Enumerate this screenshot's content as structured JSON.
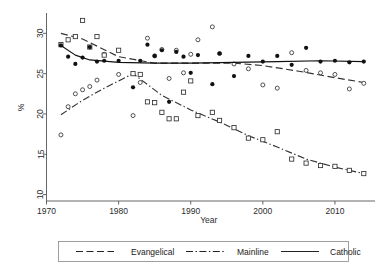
{
  "chart_data": {
    "type": "scatter",
    "title": "",
    "xlabel": "Year",
    "ylabel": "%",
    "xlim": [
      1970,
      2015
    ],
    "ylim": [
      9.2,
      32.4
    ],
    "xticks": [
      1970,
      1980,
      1990,
      2000,
      2010
    ],
    "yticks": [
      10,
      15,
      20,
      25,
      30
    ],
    "grid": false,
    "legend_position": "bottom",
    "series": [
      {
        "name": "Evangelical",
        "marker": "open-circle",
        "line_style": "dashed",
        "color": "#333333",
        "points": [
          {
            "x": 1972,
            "y": 17.4
          },
          {
            "x": 1973,
            "y": 20.9
          },
          {
            "x": 1974,
            "y": 22.5
          },
          {
            "x": 1975,
            "y": 23.0
          },
          {
            "x": 1976,
            "y": 23.4
          },
          {
            "x": 1977,
            "y": 24.2
          },
          {
            "x": 1978,
            "y": 27.4
          },
          {
            "x": 1980,
            "y": 24.9
          },
          {
            "x": 1982,
            "y": 19.8
          },
          {
            "x": 1983,
            "y": 23.9
          },
          {
            "x": 1984,
            "y": 29.4
          },
          {
            "x": 1985,
            "y": 27.2
          },
          {
            "x": 1986,
            "y": 28.0
          },
          {
            "x": 1987,
            "y": 24.4
          },
          {
            "x": 1988,
            "y": 27.9
          },
          {
            "x": 1989,
            "y": 25.1
          },
          {
            "x": 1990,
            "y": 27.4
          },
          {
            "x": 1991,
            "y": 29.2
          },
          {
            "x": 1993,
            "y": 30.8
          },
          {
            "x": 1994,
            "y": 27.5
          },
          {
            "x": 1996,
            "y": 26.2
          },
          {
            "x": 1998,
            "y": 25.6
          },
          {
            "x": 2000,
            "y": 23.6
          },
          {
            "x": 2002,
            "y": 23.2
          },
          {
            "x": 2004,
            "y": 27.6
          },
          {
            "x": 2006,
            "y": 25.4
          },
          {
            "x": 2008,
            "y": 25.1
          },
          {
            "x": 2010,
            "y": 24.9
          },
          {
            "x": 2012,
            "y": 23.1
          },
          {
            "x": 2014,
            "y": 23.8
          }
        ],
        "trend": [
          {
            "x": 1972,
            "y": 30.0
          },
          {
            "x": 1975,
            "y": 29.3
          },
          {
            "x": 1980,
            "y": 27.1
          },
          {
            "x": 1985,
            "y": 26.3
          },
          {
            "x": 1990,
            "y": 26.3
          },
          {
            "x": 1996,
            "y": 26.3
          },
          {
            "x": 2000,
            "y": 26.0
          },
          {
            "x": 2005,
            "y": 25.3
          },
          {
            "x": 2010,
            "y": 24.5
          },
          {
            "x": 2014,
            "y": 23.9
          }
        ]
      },
      {
        "name": "Mainline",
        "marker": "open-square",
        "line_style": "dash-dot",
        "color": "#333333",
        "points": [
          {
            "x": 1972,
            "y": 28.6
          },
          {
            "x": 1973,
            "y": 29.2
          },
          {
            "x": 1974,
            "y": 29.6
          },
          {
            "x": 1975,
            "y": 31.6
          },
          {
            "x": 1976,
            "y": 28.3
          },
          {
            "x": 1977,
            "y": 29.6
          },
          {
            "x": 1978,
            "y": 27.3
          },
          {
            "x": 1980,
            "y": 27.9
          },
          {
            "x": 1982,
            "y": 25.0
          },
          {
            "x": 1983,
            "y": 24.9
          },
          {
            "x": 1984,
            "y": 21.5
          },
          {
            "x": 1985,
            "y": 21.4
          },
          {
            "x": 1986,
            "y": 20.2
          },
          {
            "x": 1987,
            "y": 19.4
          },
          {
            "x": 1988,
            "y": 19.4
          },
          {
            "x": 1989,
            "y": 22.7
          },
          {
            "x": 1990,
            "y": 24.1
          },
          {
            "x": 1991,
            "y": 19.8
          },
          {
            "x": 1993,
            "y": 20.2
          },
          {
            "x": 1994,
            "y": 19.2
          },
          {
            "x": 1996,
            "y": 18.3
          },
          {
            "x": 1998,
            "y": 17.0
          },
          {
            "x": 2000,
            "y": 16.8
          },
          {
            "x": 2002,
            "y": 17.8
          },
          {
            "x": 2004,
            "y": 14.4
          },
          {
            "x": 2006,
            "y": 13.9
          },
          {
            "x": 2008,
            "y": 13.6
          },
          {
            "x": 2010,
            "y": 13.5
          },
          {
            "x": 2012,
            "y": 13.0
          },
          {
            "x": 2014,
            "y": 12.6
          }
        ],
        "trend": [
          {
            "x": 1972,
            "y": 19.9
          },
          {
            "x": 1975,
            "y": 21.7
          },
          {
            "x": 1978,
            "y": 23.2
          },
          {
            "x": 1982,
            "y": 25.0
          },
          {
            "x": 1986,
            "y": 22.3
          },
          {
            "x": 1990,
            "y": 20.5
          },
          {
            "x": 1994,
            "y": 19.0
          },
          {
            "x": 1998,
            "y": 17.3
          },
          {
            "x": 2002,
            "y": 15.9
          },
          {
            "x": 2006,
            "y": 14.4
          },
          {
            "x": 2010,
            "y": 13.4
          },
          {
            "x": 2014,
            "y": 12.6
          }
        ]
      },
      {
        "name": "Catholic",
        "marker": "filled-circle",
        "line_style": "solid",
        "color": "#111111",
        "points": [
          {
            "x": 1972,
            "y": 28.5
          },
          {
            "x": 1973,
            "y": 27.1
          },
          {
            "x": 1974,
            "y": 26.2
          },
          {
            "x": 1975,
            "y": 27.0
          },
          {
            "x": 1976,
            "y": 28.3
          },
          {
            "x": 1977,
            "y": 26.5
          },
          {
            "x": 1978,
            "y": 26.6
          },
          {
            "x": 1980,
            "y": 26.6
          },
          {
            "x": 1982,
            "y": 23.3
          },
          {
            "x": 1983,
            "y": 26.6
          },
          {
            "x": 1984,
            "y": 28.6
          },
          {
            "x": 1985,
            "y": 27.2
          },
          {
            "x": 1986,
            "y": 27.9
          },
          {
            "x": 1987,
            "y": 21.5
          },
          {
            "x": 1988,
            "y": 27.7
          },
          {
            "x": 1989,
            "y": 27.1
          },
          {
            "x": 1990,
            "y": 25.1
          },
          {
            "x": 1991,
            "y": 27.3
          },
          {
            "x": 1993,
            "y": 23.7
          },
          {
            "x": 1994,
            "y": 27.5
          },
          {
            "x": 1996,
            "y": 24.7
          },
          {
            "x": 1998,
            "y": 27.2
          },
          {
            "x": 2000,
            "y": 26.5
          },
          {
            "x": 2002,
            "y": 27.2
          },
          {
            "x": 2004,
            "y": 26.1
          },
          {
            "x": 2006,
            "y": 28.2
          },
          {
            "x": 2008,
            "y": 26.5
          },
          {
            "x": 2010,
            "y": 26.6
          },
          {
            "x": 2012,
            "y": 26.4
          },
          {
            "x": 2014,
            "y": 26.5
          }
        ],
        "trend": [
          {
            "x": 1972,
            "y": 28.5
          },
          {
            "x": 1974,
            "y": 27.3
          },
          {
            "x": 1976,
            "y": 26.7
          },
          {
            "x": 1980,
            "y": 26.4
          },
          {
            "x": 1985,
            "y": 26.3
          },
          {
            "x": 1990,
            "y": 26.3
          },
          {
            "x": 1996,
            "y": 26.4
          },
          {
            "x": 2002,
            "y": 26.5
          },
          {
            "x": 2008,
            "y": 26.6
          },
          {
            "x": 2014,
            "y": 26.5
          }
        ]
      }
    ]
  },
  "axes": {
    "ylabel": "%",
    "xlabel": "Year",
    "xticks": [
      "1970",
      "1980",
      "1990",
      "2000",
      "2010"
    ],
    "yticks": [
      "10",
      "15",
      "20",
      "25",
      "30"
    ]
  },
  "legend": {
    "items": [
      {
        "label": "Evangelical",
        "style": "dashed"
      },
      {
        "label": "Mainline",
        "style": "dash-dot"
      },
      {
        "label": "Catholic",
        "style": "solid"
      }
    ]
  }
}
